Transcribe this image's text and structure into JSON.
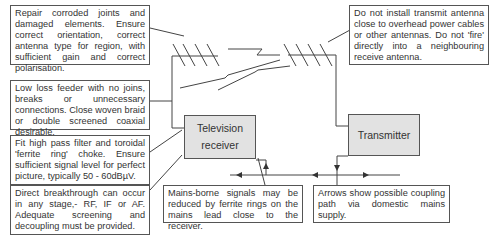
{
  "notes": {
    "antenna_repair": "Repair corroded joints and damaged elements. Ensure correct orientation, correct antenna type for region, with sufficient gain and correct polarisation.",
    "feeder": "Low loss feeder with no joins, breaks or unnecessary connections. Close woven braid or double screened coaxial desirable.",
    "filter": "Fit high pass filter and toroidal 'ferrite ring' choke. Ensure sufficient signal level for perfect picture, typically 50 - 60dBµV.",
    "breakthrough": "Direct breakthrough can occur in any stage,- RF, IF or AF. Adequate screening and decoupling must be provided.",
    "transmit_antenna": "Do not install transmit antenna close to overhead power cables or other antennas. Do not 'fire' directly into a neighbouring receive antenna.",
    "mains_borne": "Mains-borne signals may be reduced by ferrite rings on the mains lead close to the receiver.",
    "arrows": "Arrows show possible coupling path via domestic mains supply."
  },
  "blocks": {
    "tv_line1": "Television",
    "tv_line2": "receiver",
    "transmitter": "Transmitter"
  },
  "colors": {
    "line": "#444444",
    "block_fill": "#e2e2e2",
    "border": "#555555"
  }
}
